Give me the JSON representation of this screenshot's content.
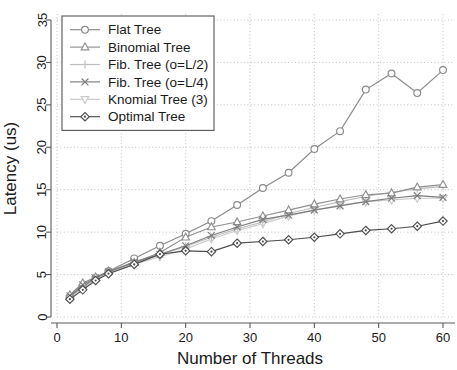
{
  "chart_data": {
    "type": "line",
    "title": "",
    "xlabel": "Number of Threads",
    "ylabel": "Latency (us)",
    "xlim": [
      0,
      62
    ],
    "ylim": [
      0,
      36
    ],
    "xticks": [
      0,
      10,
      20,
      30,
      40,
      50,
      60
    ],
    "yticks": [
      0,
      5,
      10,
      15,
      20,
      25,
      30,
      35
    ],
    "grid": true,
    "legend_position": "top-left",
    "series": [
      {
        "name": "Flat Tree",
        "marker": "circle",
        "color": "#8a8a8a",
        "x": [
          2,
          4,
          6,
          8,
          12,
          16,
          20,
          24,
          28,
          32,
          36,
          40,
          44,
          48,
          52,
          56,
          60
        ],
        "y": [
          2.4,
          3.6,
          4.6,
          5.4,
          6.9,
          8.4,
          9.8,
          11.3,
          13.2,
          15.2,
          17.0,
          19.8,
          21.9,
          26.8,
          28.7,
          26.4,
          29.1
        ]
      },
      {
        "name": "Binomial Tree",
        "marker": "triangle-up",
        "color": "#8f8f8f",
        "x": [
          2,
          4,
          6,
          8,
          12,
          16,
          20,
          24,
          28,
          32,
          36,
          40,
          44,
          48,
          52,
          56,
          60
        ],
        "y": [
          2.6,
          4.0,
          4.7,
          5.4,
          6.4,
          7.6,
          9.4,
          10.6,
          11.2,
          11.9,
          12.6,
          13.3,
          13.9,
          14.4,
          14.6,
          15.3,
          15.6
        ]
      },
      {
        "name": "Fib. Tree (o=L/2)",
        "marker": "plus",
        "color": "#bdbdbd",
        "x": [
          2,
          4,
          6,
          8,
          12,
          16,
          20,
          24,
          28,
          32,
          36,
          40,
          44,
          48,
          52,
          56,
          60
        ],
        "y": [
          2.3,
          3.5,
          4.5,
          5.3,
          6.4,
          7.3,
          8.3,
          9.4,
          10.4,
          11.2,
          12.2,
          12.9,
          13.6,
          14.2,
          14.7,
          15.1,
          15.4
        ]
      },
      {
        "name": "Fib. Tree (o=L/4)",
        "marker": "cross",
        "color": "#7d7d7d",
        "x": [
          2,
          4,
          6,
          8,
          12,
          16,
          20,
          24,
          28,
          32,
          36,
          40,
          44,
          48,
          52,
          56,
          60
        ],
        "y": [
          2.5,
          3.8,
          4.6,
          5.3,
          6.5,
          7.4,
          8.4,
          9.6,
          10.6,
          11.5,
          12.0,
          12.6,
          13.1,
          13.6,
          14.0,
          14.3,
          14.1
        ]
      },
      {
        "name": "Knomial Tree (3)",
        "marker": "triangle-down",
        "color": "#c9c9c9",
        "x": [
          2,
          4,
          6,
          8,
          12,
          16,
          20,
          24,
          28,
          32,
          36,
          40,
          44,
          48,
          52,
          56,
          60
        ],
        "y": [
          2.2,
          3.4,
          4.4,
          5.2,
          6.2,
          7.1,
          8.0,
          9.2,
          10.2,
          11.0,
          11.9,
          12.6,
          13.2,
          13.6,
          13.8,
          14.0,
          14.0
        ]
      },
      {
        "name": "Optimal Tree",
        "marker": "diamond",
        "color": "#4d4d4d",
        "x": [
          2,
          4,
          6,
          8,
          12,
          16,
          20,
          24,
          28,
          32,
          36,
          40,
          44,
          48,
          52,
          56,
          60
        ],
        "y": [
          2.1,
          3.2,
          4.3,
          5.1,
          6.2,
          7.4,
          7.8,
          7.7,
          8.7,
          8.9,
          9.1,
          9.4,
          9.8,
          10.2,
          10.4,
          10.7,
          11.3
        ]
      }
    ]
  }
}
